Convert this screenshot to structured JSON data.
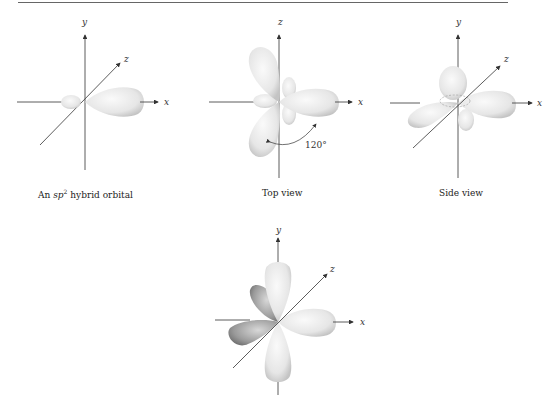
{
  "panels": [
    {
      "id": "sp2-orbital",
      "caption_prefix": "An ",
      "caption_italic": "sp",
      "caption_sup": "2",
      "caption_suffix": " hybrid orbital",
      "axes": {
        "y": "y",
        "z": "z",
        "x": "x"
      }
    },
    {
      "id": "top-view",
      "caption": "Top view",
      "axes": {
        "z": "z",
        "x": "x"
      },
      "angle_label": "120°"
    },
    {
      "id": "side-view",
      "caption": "Side view",
      "axes": {
        "y": "y",
        "z": "z",
        "x": "x"
      }
    },
    {
      "id": "combined",
      "caption": "",
      "axes": {
        "y": "y",
        "z": "z",
        "x": "x"
      }
    }
  ],
  "colors": {
    "lobe_light": "#f4f4f4",
    "lobe_mid": "#dcdcdc",
    "lobe_dark": "#a8a8a8",
    "axis": "#333333"
  }
}
